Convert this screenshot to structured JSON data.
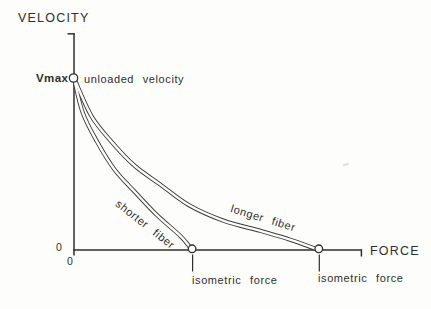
{
  "figure": {
    "y_axis_title": "VELOCITY",
    "x_axis_title": "FORCE",
    "vmax_label": "Vmax",
    "unloaded_velocity_label": "unloaded velocity",
    "y_zero_label": "0",
    "x_zero_label": "0",
    "shorter_fiber_label": "shorter fiber",
    "longer_fiber_label": "longer fiber",
    "shorter_isometric_label": "isometric force",
    "longer_isometric_label": "isometric force"
  },
  "colors": {
    "ink": "#2e2e2e",
    "background": "#fdfdfb",
    "curve_stroke": "#3a3a3a"
  },
  "chart_data": {
    "type": "line",
    "title": "",
    "xlabel": "FORCE",
    "ylabel": "VELOCITY",
    "x_tick_labels": [
      "0"
    ],
    "y_tick_labels": [
      "0",
      "Vmax"
    ],
    "axis_numeric_scale": "unlabeled; values normalized (force = fraction of drawn x-axis, velocity = fraction of Vmax)",
    "xlim": [
      0,
      1
    ],
    "ylim": [
      0,
      1
    ],
    "grid": false,
    "legend": "labels written along curves",
    "series": [
      {
        "name": "shorter fiber",
        "isometric_force": 0.41,
        "points": [
          [
            0,
            1
          ],
          [
            0.03,
            0.8
          ],
          [
            0.08,
            0.63
          ],
          [
            0.14,
            0.47
          ],
          [
            0.21,
            0.34
          ],
          [
            0.29,
            0.2
          ],
          [
            0.37,
            0.08
          ],
          [
            0.41,
            0
          ]
        ]
      },
      {
        "name": "longer fiber",
        "isometric_force": 0.85,
        "points": [
          [
            0,
            1
          ],
          [
            0.06,
            0.78
          ],
          [
            0.13,
            0.63
          ],
          [
            0.21,
            0.49
          ],
          [
            0.3,
            0.38
          ],
          [
            0.4,
            0.26
          ],
          [
            0.52,
            0.17
          ],
          [
            0.65,
            0.11
          ],
          [
            0.75,
            0.06
          ],
          [
            0.85,
            0
          ]
        ]
      }
    ],
    "annotations": [
      {
        "text": "unloaded velocity",
        "at": "Vmax intercept on velocity axis, open circle marker"
      },
      {
        "text": "isometric force",
        "at": "shorter-fiber x-intercept, open circle marker with leader line"
      },
      {
        "text": "isometric force",
        "at": "longer-fiber x-intercept, open circle marker with leader line"
      }
    ],
    "style": "hand-drafted scanned figure; each curve drawn as an open double-line tube; open circles at Vmax and both isometric-force intercepts; short end-ticks cap the axes"
  }
}
